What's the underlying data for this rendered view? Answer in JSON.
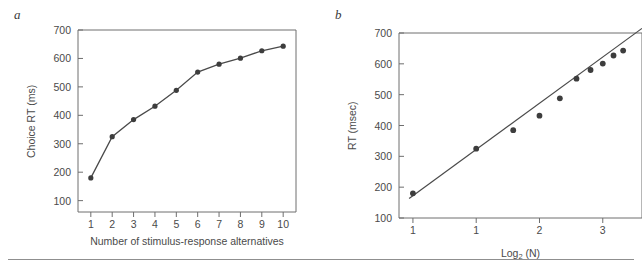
{
  "figure": {
    "panels": [
      {
        "id": "a",
        "label": "a",
        "x_title": "Number of stimulus-response alternatives",
        "y_title": "Choice RT (ms)"
      },
      {
        "id": "b",
        "label": "b",
        "x_title_main": "Log",
        "x_title_sub": "2",
        "x_title_tail": " (N)",
        "y_title": "RT (msec)"
      }
    ],
    "colors": {
      "ink": "#4a4a4a",
      "axis": "#6e6e6e",
      "marker": "#3d3d3d",
      "line": "#4a4a4a",
      "rule": "#8f8f8f"
    }
  },
  "chart_data": [
    {
      "type": "line",
      "panel": "a",
      "title": "",
      "xlabel": "Number of stimulus-response alternatives",
      "ylabel": "Choice RT (ms)",
      "x": [
        1,
        2,
        3,
        4,
        5,
        6,
        7,
        8,
        9,
        10
      ],
      "y": [
        180,
        325,
        385,
        432,
        488,
        552,
        580,
        601,
        627,
        643
      ],
      "xlim": [
        0.4,
        10.6
      ],
      "ylim": [
        60,
        700
      ],
      "xticks": [
        1,
        2,
        3,
        4,
        5,
        6,
        7,
        8,
        9,
        10
      ],
      "xticklabels": [
        "1",
        "2",
        "3",
        "4",
        "5",
        "6",
        "7",
        "8",
        "9",
        "10"
      ],
      "yticks": [
        100,
        200,
        300,
        400,
        500,
        600,
        700
      ],
      "yticklabels": [
        "100",
        "200",
        "300",
        "400",
        "500",
        "600",
        "700"
      ],
      "grid": false,
      "legend": "none",
      "markers": true
    },
    {
      "type": "scatter",
      "panel": "b",
      "title": "",
      "xlabel": "Log2 (N)",
      "ylabel": "RT (msec)",
      "x": [
        0.0,
        1.0,
        1.585,
        2.0,
        2.322,
        2.585,
        2.807,
        3.0,
        3.17,
        3.322
      ],
      "y": [
        180,
        325,
        385,
        432,
        488,
        552,
        580,
        601,
        627,
        643
      ],
      "xlim": [
        -0.22,
        3.62
      ],
      "ylim": [
        100,
        700
      ],
      "xticks": [
        0,
        1,
        2,
        3
      ],
      "xticklabels": [
        "1",
        "1",
        "2",
        "3"
      ],
      "yticks": [
        100,
        200,
        300,
        400,
        500,
        600,
        700
      ],
      "yticklabels": [
        "100",
        "200",
        "300",
        "400",
        "500",
        "600",
        "700"
      ],
      "grid": false,
      "legend": "none",
      "fit_line": {
        "intercept": 172,
        "slope": 150,
        "x_start": -0.06,
        "x_end": 3.62
      }
    }
  ]
}
